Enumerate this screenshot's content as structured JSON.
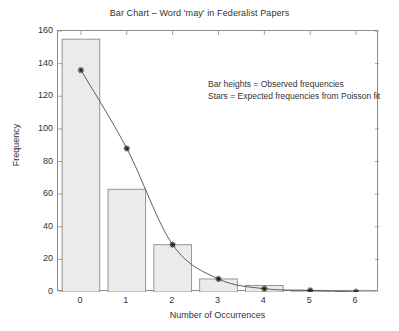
{
  "chart_data": {
    "type": "bar",
    "title": "Bar Chart – Word 'may' in Federalist Papers",
    "xlabel": "Number of Occurrences",
    "ylabel": "Frequency",
    "categories": [
      "0",
      "1",
      "2",
      "3",
      "4",
      "5",
      "6"
    ],
    "values": [
      155,
      63,
      29,
      8,
      4,
      1,
      1
    ],
    "series": [
      {
        "name": "Observed frequencies",
        "type": "bar",
        "values": [
          155,
          63,
          29,
          8,
          4,
          1,
          1
        ]
      },
      {
        "name": "Expected frequencies from Poisson fit",
        "type": "line-with-star-markers",
        "values": [
          136,
          88,
          29,
          8,
          2,
          1,
          0
        ]
      }
    ],
    "ylim": [
      0,
      160
    ],
    "yticks": [
      0,
      20,
      40,
      60,
      80,
      100,
      120,
      140,
      160
    ],
    "xticks": [
      0,
      1,
      2,
      3,
      4,
      5,
      6
    ],
    "grid": false,
    "legend_position": "none",
    "annotations": [
      "Bar heights = Observed frequencies",
      "Stars = Expected frequencies from Poisson fit"
    ],
    "colors": {
      "bar_fill": "#ebebeb",
      "bar_edge": "#8c8c8c",
      "curve": "#4d4d4d",
      "marker": "#1a1a1a",
      "axis": "#8c8c8c",
      "text": "#333333",
      "background": "#ffffff"
    }
  }
}
